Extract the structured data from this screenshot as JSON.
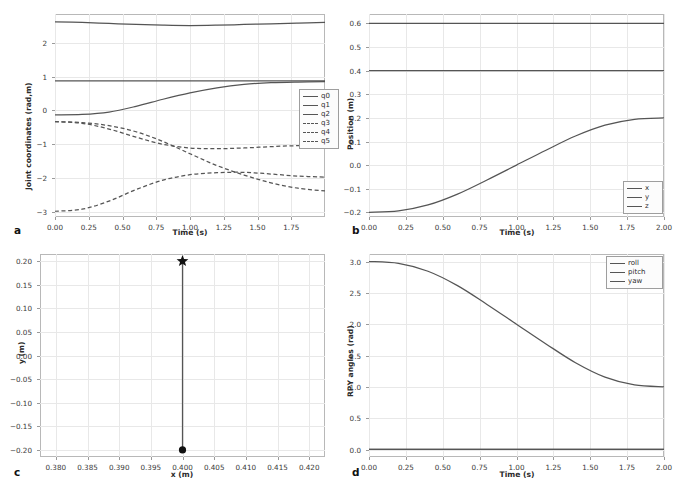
{
  "figure": {
    "panels": [
      "a",
      "b",
      "c",
      "d"
    ],
    "background": "#ffffff",
    "grid_color": "#e8e8e8",
    "line_color": "#555555"
  },
  "panel_a": {
    "letter": "a",
    "xlabel": "Time (s)",
    "ylabel": "Joint coordinates (rad,m)",
    "xticks": [
      "0.00",
      "0.25",
      "0.50",
      "0.75",
      "1.00",
      "1.25",
      "1.50",
      "1.75"
    ],
    "yticks": [
      "2",
      "1",
      "0",
      "-1",
      "-2",
      "-3"
    ],
    "legend": [
      {
        "label": "q0",
        "style": "solid"
      },
      {
        "label": "q1",
        "style": "solid"
      },
      {
        "label": "q2",
        "style": "solid"
      },
      {
        "label": "q3",
        "style": "dashed"
      },
      {
        "label": "q4",
        "style": "dashed"
      },
      {
        "label": "q5",
        "style": "dashed"
      }
    ]
  },
  "panel_b": {
    "letter": "b",
    "xlabel": "Time (s)",
    "ylabel": "Position (m)",
    "xticks": [
      "0.00",
      "0.25",
      "0.50",
      "0.75",
      "1.00",
      "1.25",
      "1.50",
      "1.75",
      "2.00"
    ],
    "yticks": [
      "0.6",
      "0.5",
      "0.4",
      "0.3",
      "0.2",
      "0.1",
      "0.0",
      "-0.1",
      "-0.2"
    ],
    "legend": [
      {
        "label": "x",
        "style": "solid"
      },
      {
        "label": "y",
        "style": "solid"
      },
      {
        "label": "z",
        "style": "solid"
      }
    ]
  },
  "panel_c": {
    "letter": "c",
    "xlabel": "x (m)",
    "ylabel": "y (m)",
    "xticks": [
      "0.380",
      "0.385",
      "0.390",
      "0.395",
      "0.400",
      "0.405",
      "0.410",
      "0.415",
      "0.420"
    ],
    "yticks": [
      "0.20",
      "0.15",
      "0.10",
      "0.05",
      "0.00",
      "-0.05",
      "-0.10",
      "-0.15",
      "-0.20"
    ]
  },
  "panel_d": {
    "letter": "d",
    "xlabel": "Time (s)",
    "ylabel": "RPY angles (rad)",
    "xticks": [
      "0.00",
      "0.25",
      "0.50",
      "0.75",
      "1.00",
      "1.25",
      "1.50",
      "1.75",
      "2.00"
    ],
    "yticks": [
      "3.0",
      "2.5",
      "2.0",
      "1.5",
      "1.0",
      "0.5",
      "0.0"
    ],
    "legend": [
      {
        "label": "roll",
        "style": "solid"
      },
      {
        "label": "pitch",
        "style": "solid"
      },
      {
        "label": "yaw",
        "style": "solid"
      }
    ]
  },
  "chart_data": [
    {
      "panel": "a",
      "type": "line",
      "title": "",
      "xlabel": "Time (s)",
      "ylabel": "Joint coordinates (rad,m)",
      "xlim": [
        0.0,
        2.0
      ],
      "ylim": [
        -3.15,
        2.85
      ],
      "grid": true,
      "legend_position": "center-right",
      "x": [
        0.0,
        0.2,
        0.4,
        0.6,
        0.8,
        1.0,
        1.2,
        1.4,
        1.6,
        1.8,
        2.0
      ],
      "series": [
        {
          "name": "q0",
          "style": "dashed_na_solid",
          "linestyle": "solid",
          "values": [
            -0.13,
            -0.12,
            -0.05,
            0.12,
            0.33,
            0.52,
            0.67,
            0.77,
            0.82,
            0.84,
            0.85
          ]
        },
        {
          "name": "q1",
          "style": "solid",
          "linestyle": "solid",
          "values": [
            0.87,
            0.87,
            0.87,
            0.87,
            0.87,
            0.87,
            0.87,
            0.87,
            0.87,
            0.87,
            0.87
          ]
        },
        {
          "name": "q2",
          "style": "solid",
          "linestyle": "solid",
          "values": [
            2.62,
            2.6,
            2.57,
            2.54,
            2.52,
            2.51,
            2.52,
            2.54,
            2.56,
            2.58,
            2.6
          ]
        },
        {
          "name": "q3",
          "style": "dashed",
          "linestyle": "dashed",
          "values": [
            -0.33,
            -0.38,
            -0.55,
            -0.79,
            -1.0,
            -1.11,
            -1.13,
            -1.11,
            -1.07,
            -1.04,
            -1.02
          ]
        },
        {
          "name": "q4",
          "style": "dashed",
          "linestyle": "dashed",
          "values": [
            -0.33,
            -0.36,
            -0.45,
            -0.63,
            -0.92,
            -1.28,
            -1.63,
            -1.91,
            -2.14,
            -2.3,
            -2.38
          ]
        },
        {
          "name": "q5",
          "style": "dashed",
          "linestyle": "dashed",
          "values": [
            -2.98,
            -2.92,
            -2.68,
            -2.34,
            -2.06,
            -1.9,
            -1.84,
            -1.83,
            -1.88,
            -1.94,
            -1.97
          ]
        }
      ]
    },
    {
      "panel": "b",
      "type": "line",
      "title": "",
      "xlabel": "Time (s)",
      "ylabel": "Position (m)",
      "xlim": [
        0.0,
        2.0
      ],
      "ylim": [
        -0.22,
        0.64
      ],
      "grid": true,
      "legend_position": "lower-right",
      "x": [
        0.0,
        0.2,
        0.4,
        0.6,
        0.8,
        1.0,
        1.2,
        1.4,
        1.6,
        1.8,
        2.0
      ],
      "series": [
        {
          "name": "x",
          "linestyle": "solid",
          "values": [
            0.4,
            0.4,
            0.4,
            0.4,
            0.4,
            0.4,
            0.4,
            0.4,
            0.4,
            0.4,
            0.4
          ]
        },
        {
          "name": "y",
          "linestyle": "solid",
          "values": [
            -0.2,
            -0.194,
            -0.169,
            -0.123,
            -0.063,
            0.0,
            0.063,
            0.123,
            0.169,
            0.194,
            0.2
          ]
        },
        {
          "name": "z",
          "linestyle": "solid",
          "values": [
            0.6,
            0.6,
            0.6,
            0.6,
            0.6,
            0.6,
            0.6,
            0.6,
            0.6,
            0.6,
            0.6
          ]
        }
      ]
    },
    {
      "panel": "c",
      "type": "line",
      "title": "",
      "xlabel": "x (m)",
      "ylabel": "y (m)",
      "xlim": [
        0.3775,
        0.4225
      ],
      "ylim": [
        -0.215,
        0.215
      ],
      "grid": true,
      "legend_position": "none",
      "x": [
        0.4,
        0.4
      ],
      "y": [
        -0.2,
        0.2
      ],
      "markers": [
        {
          "name": "start",
          "shape": "circle",
          "x": 0.4,
          "y": -0.2
        },
        {
          "name": "goal",
          "shape": "star",
          "x": 0.4,
          "y": 0.2
        }
      ]
    },
    {
      "panel": "d",
      "type": "line",
      "title": "",
      "xlabel": "Time (s)",
      "ylabel": "RPY angles (rad)",
      "xlim": [
        0.0,
        2.0
      ],
      "ylim": [
        -0.12,
        3.12
      ],
      "grid": true,
      "legend_position": "upper-right",
      "x": [
        0.0,
        0.2,
        0.4,
        0.6,
        0.8,
        1.0,
        1.2,
        1.4,
        1.6,
        1.8,
        2.0
      ],
      "series": [
        {
          "name": "roll",
          "linestyle": "solid",
          "values": [
            0.0,
            0.0,
            0.0,
            0.0,
            0.0,
            0.0,
            0.0,
            0.0,
            0.0,
            0.0,
            0.0
          ]
        },
        {
          "name": "pitch",
          "linestyle": "solid",
          "values": [
            0.0,
            0.0,
            0.0,
            0.0,
            0.0,
            0.0,
            0.0,
            0.0,
            0.0,
            0.0,
            0.0
          ]
        },
        {
          "name": "yaw",
          "linestyle": "solid",
          "values": [
            3.0,
            2.97,
            2.845,
            2.615,
            2.315,
            2.0,
            1.685,
            1.385,
            1.155,
            1.03,
            1.0
          ]
        }
      ]
    }
  ]
}
